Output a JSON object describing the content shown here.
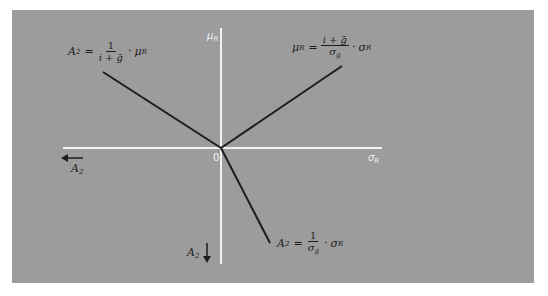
{
  "diagram": {
    "type": "quadrant-diagram",
    "background_color": "#9c9c9c",
    "axis_color": "#f2f2f2",
    "line_color": "#1c1c1c",
    "axes": {
      "vertical_label": "μ",
      "vertical_label_sub": "R",
      "horizontal_label": "σ",
      "horizontal_label_sub": "R",
      "origin_label": "0"
    },
    "directions": {
      "left_arrow_label": "A",
      "left_arrow_sub": "2",
      "down_arrow_label": "A",
      "down_arrow_sub": "2"
    },
    "equations": {
      "upper_left": {
        "lhs": "A",
        "lhs_sub": "2",
        "eq": "=",
        "num": "1",
        "den": "i + ḡ",
        "dot": "·",
        "rhs": "μ",
        "rhs_sub": "R"
      },
      "upper_right": {
        "lhs": "μ",
        "lhs_sub": "R",
        "eq": "=",
        "num": "i + ḡ",
        "den": "σ",
        "den_sub": "g",
        "dot": "·",
        "rhs": "σ",
        "rhs_sub": "R"
      },
      "lower": {
        "lhs": "A",
        "lhs_sub": "2",
        "eq": "=",
        "num": "1",
        "den": "σ",
        "den_sub": "g",
        "dot": "·",
        "rhs": "σ",
        "rhs_sub": "R"
      }
    }
  }
}
